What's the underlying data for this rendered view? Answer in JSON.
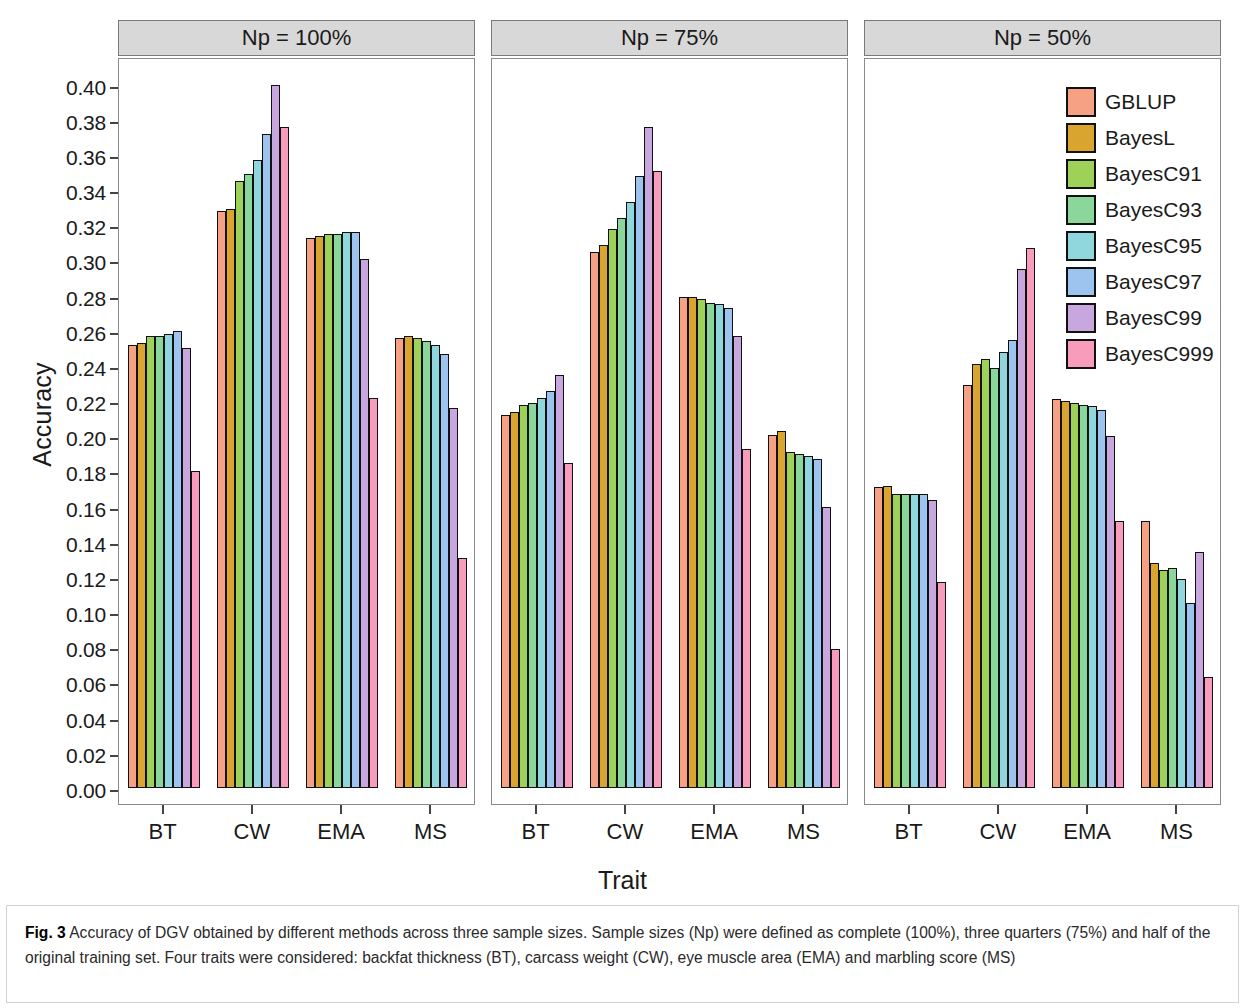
{
  "figure": {
    "label": "Fig. 3",
    "caption": "Accuracy of DGV obtained by different methods across three sample sizes. Sample sizes (Np) were defined as complete (100%), three quarters (75%) and half of the original training set. Four traits were considered: backfat thickness (BT), carcass weight (CW), eye muscle area (EMA) and marbling score (MS)"
  },
  "chart_data": {
    "type": "bar",
    "title": "",
    "xlabel": "Trait",
    "ylabel": "Accuracy",
    "ylim": [
      0.0,
      0.41
    ],
    "yticks": [
      "0.00",
      "0.02",
      "0.04",
      "0.06",
      "0.08",
      "0.10",
      "0.12",
      "0.14",
      "0.16",
      "0.18",
      "0.20",
      "0.22",
      "0.24",
      "0.26",
      "0.28",
      "0.30",
      "0.32",
      "0.34",
      "0.36",
      "0.38",
      "0.40"
    ],
    "ytick_values": [
      0.0,
      0.02,
      0.04,
      0.06,
      0.08,
      0.1,
      0.12,
      0.14,
      0.16,
      0.18,
      0.2,
      0.22,
      0.24,
      0.26,
      0.28,
      0.3,
      0.32,
      0.34,
      0.36,
      0.38,
      0.4
    ],
    "grid": false,
    "legend_position": "right",
    "categories": [
      "BT",
      "CW",
      "EMA",
      "MS"
    ],
    "series": [
      {
        "name": "GBLUP",
        "color": "#f6a183"
      },
      {
        "name": "BayesL",
        "color": "#d9a52e"
      },
      {
        "name": "BayesC91",
        "color": "#9ed157"
      },
      {
        "name": "BayesC93",
        "color": "#8bd69a"
      },
      {
        "name": "BayesC95",
        "color": "#8fd7dd"
      },
      {
        "name": "BayesC97",
        "color": "#9cc4ef"
      },
      {
        "name": "BayesC99",
        "color": "#c7a7dd"
      },
      {
        "name": "BayesC999",
        "color": "#f79cbb"
      }
    ],
    "panels": [
      {
        "label": "Np = 100%",
        "data": {
          "BT": [
            0.252,
            0.253,
            0.257,
            0.257,
            0.258,
            0.26,
            0.25,
            0.18
          ],
          "CW": [
            0.328,
            0.329,
            0.345,
            0.349,
            0.357,
            0.372,
            0.4,
            0.376
          ],
          "EMA": [
            0.313,
            0.314,
            0.315,
            0.315,
            0.316,
            0.316,
            0.301,
            0.222
          ],
          "MS": [
            0.256,
            0.257,
            0.256,
            0.254,
            0.252,
            0.247,
            0.216,
            0.131
          ]
        }
      },
      {
        "label": "Np = 75%",
        "data": {
          "BT": [
            0.212,
            0.214,
            0.218,
            0.219,
            0.222,
            0.226,
            0.235,
            0.185
          ],
          "CW": [
            0.305,
            0.309,
            0.318,
            0.324,
            0.333,
            0.348,
            0.376,
            0.351
          ],
          "EMA": [
            0.279,
            0.279,
            0.278,
            0.276,
            0.275,
            0.273,
            0.257,
            0.193
          ],
          "MS": [
            0.201,
            0.203,
            0.191,
            0.19,
            0.189,
            0.187,
            0.16,
            0.079
          ]
        }
      },
      {
        "label": "Np = 50%",
        "data": {
          "BT": [
            0.171,
            0.172,
            0.167,
            0.167,
            0.167,
            0.167,
            0.164,
            0.117
          ],
          "CW": [
            0.229,
            0.241,
            0.244,
            0.239,
            0.248,
            0.255,
            0.295,
            0.307
          ],
          "EMA": [
            0.221,
            0.22,
            0.219,
            0.218,
            0.217,
            0.215,
            0.2,
            0.152
          ],
          "MS": [
            0.152,
            0.128,
            0.124,
            0.125,
            0.119,
            0.105,
            0.134,
            0.063
          ]
        }
      }
    ]
  }
}
